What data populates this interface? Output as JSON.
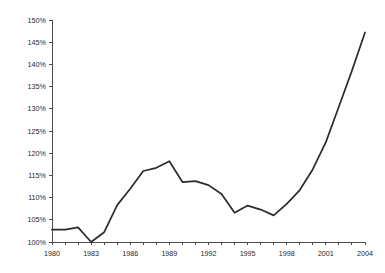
{
  "figure": {
    "background_color": "#ffffff",
    "line_color": "#2b2b2b",
    "axis_color": "#4d4d4d",
    "text_color": "#1f1f1f"
  },
  "scan_artifact": {
    "visible": true,
    "fragments": [
      "the",
      "of",
      "index",
      "relative",
      "series",
      "a",
      "in",
      "and"
    ]
  },
  "chart_data": {
    "type": "line",
    "title": "",
    "subtitle": "",
    "xlabel": "",
    "ylabel": "",
    "xlim": [
      1980,
      2004
    ],
    "ylim": [
      100,
      150
    ],
    "grid": false,
    "legend": null,
    "legend_position": "none",
    "y_tick_labels": [
      "100%",
      "105%",
      "110%",
      "115%",
      "120%",
      "125%",
      "130%",
      "135%",
      "140%",
      "145%",
      "150%"
    ],
    "y_tick_values": [
      100,
      105,
      110,
      115,
      120,
      125,
      130,
      135,
      140,
      145,
      150
    ],
    "x_tick_labels": [
      "1980",
      "1983",
      "1986",
      "1989",
      "1992",
      "1995",
      "1998",
      "2001",
      "2004"
    ],
    "x_tick_values": [
      1980,
      1983,
      1986,
      1989,
      1992,
      1995,
      1998,
      2001,
      2004
    ],
    "x_minor_tick_values": [
      1980,
      1981,
      1982,
      1983,
      1984,
      1985,
      1986,
      1987,
      1988,
      1989,
      1990,
      1991,
      1992,
      1993,
      1994,
      1995,
      1996,
      1997,
      1998,
      1999,
      2000,
      2001,
      2002,
      2003,
      2004
    ],
    "series": [
      {
        "name": "index",
        "x": [
          1980,
          1981,
          1982,
          1983,
          1984,
          1985,
          1986,
          1987,
          1988,
          1989,
          1990,
          1991,
          1992,
          1993,
          1994,
          1995,
          1996,
          1997,
          1998,
          1999,
          2000,
          2001,
          2002,
          2003,
          2004
        ],
        "values": [
          102.8,
          102.8,
          103.3,
          100.0,
          102.2,
          108.3,
          112.0,
          116.0,
          116.7,
          118.2,
          113.5,
          113.7,
          112.8,
          110.8,
          106.6,
          108.2,
          107.3,
          106.0,
          108.6,
          111.7,
          116.4,
          122.5,
          130.5,
          138.6,
          147.2
        ]
      }
    ]
  }
}
